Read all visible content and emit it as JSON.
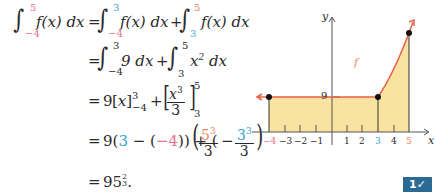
{
  "equation": {
    "lines": [
      {
        "lhs_integral": {
          "lower": "−4",
          "upper": "5",
          "integrand": "f(x) dx"
        },
        "rhs": [
          {
            "lower": "−4",
            "upper": "3",
            "integrand": "f(x) dx"
          },
          {
            "lower": "3",
            "upper": "5",
            "integrand": "f(x) dx"
          }
        ]
      },
      {
        "rhs": [
          {
            "lower": "−4",
            "upper": "3",
            "integrand": "9 dx"
          },
          {
            "lower": "3",
            "upper": "5",
            "integrand": "x² dx"
          }
        ]
      },
      {
        "text": "= 9[x]₋₄³ + [x³/3]₃⁵"
      },
      {
        "text": "= 9(3 − (−4)) + (5³/3 − 3³/3)"
      },
      {
        "text": "= 95⅔."
      }
    ],
    "eq": "=",
    "plus": "+",
    "minus": "−",
    "f_x_dx": "f(x) dx",
    "nine_dx": "9 dx",
    "x2_dx": "x",
    "lim_m4": "−4",
    "lim_3": "3",
    "lim_5": "5",
    "line3_nine": "9",
    "line3_x": "x",
    "line3_x3": "x",
    "line3_den": "3",
    "line4_prefix": "9(",
    "line4_3": "3",
    "line4_mid": " − (",
    "line4_m4": "−4",
    "line4_close": ")) + (",
    "line4_5": "5",
    "line4_den": "3",
    "line4_close2": ")",
    "result": "95",
    "result_frac_num": "2",
    "result_frac_den": "3",
    "result_end": "."
  },
  "graph": {
    "y_axis_label": "y",
    "x_axis_label": "x",
    "function_label": "f",
    "y_tick_label": "9",
    "x_ticks": [
      "−4",
      "−3",
      "−2",
      "−1",
      "1",
      "2",
      "3",
      "4",
      "5"
    ],
    "colors": {
      "curve": "#e8604a",
      "fill": "#f9e3a0",
      "lower_limit": "#e8708a",
      "split": "#3ba3d8",
      "upper_limit": "#e8875a"
    }
  },
  "badge": {
    "label": "1✓"
  }
}
